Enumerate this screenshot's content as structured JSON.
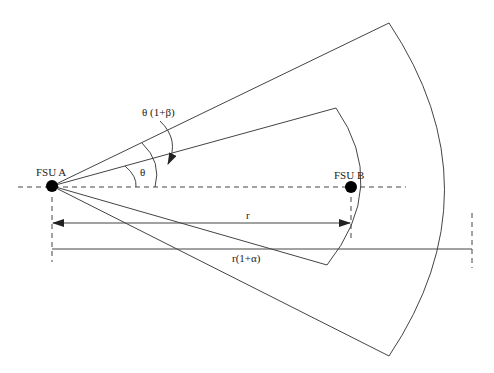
{
  "diagram": {
    "type": "sector-coverage-geometry",
    "nodes": {
      "a": {
        "label": "FSU A",
        "x": 52,
        "y": 186
      },
      "b": {
        "label": "FSU B",
        "x": 351,
        "y": 187
      }
    },
    "angles": {
      "inner": {
        "label": "θ"
      },
      "outer": {
        "label": "θ (1+β)"
      }
    },
    "distances": {
      "inner": {
        "label": "r"
      },
      "outer": {
        "label": "r(1+α)"
      }
    },
    "colors": {
      "line": "#444444",
      "node": "#000000",
      "background": "#ffffff"
    }
  }
}
